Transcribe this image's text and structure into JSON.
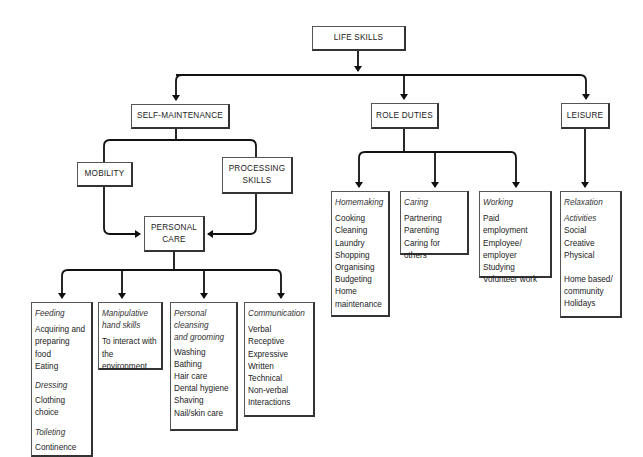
{
  "diagram": {
    "root": {
      "label": "LIFE SKILLS"
    },
    "level1": {
      "self_maintenance": "SELF-MAINTENANCE",
      "role_duties": "ROLE DUTIES",
      "leisure": "LEISURE"
    },
    "self_maintenance_children": {
      "mobility": "MOBILITY",
      "processing_line1": "PROCESSING",
      "processing_line2": "SKILLS",
      "personal_line1": "PERSONAL",
      "personal_line2": "CARE"
    },
    "personal_care_boxes": {
      "feeding": {
        "heading": "Feeding",
        "items": [
          "Acquiring and",
          "preparing food",
          "Eating"
        ],
        "heading2": "Dressing",
        "items2": [
          "Clothing",
          "choice"
        ],
        "heading3": "Toileting",
        "items3": [
          "Continence"
        ]
      },
      "manipulative": {
        "heading_line1": "Manipulative",
        "heading_line2": "hand skills",
        "items": [
          "To interact with",
          "the environment"
        ]
      },
      "cleansing": {
        "heading_line1": "Personal",
        "heading_line2": "cleansing",
        "heading_line3": "and grooming",
        "items": [
          "Washing",
          "Bathing",
          "Hair care",
          "Dental hygiene",
          "Shaving",
          "Nail/skin care"
        ]
      },
      "communication": {
        "heading": "Communication",
        "items": [
          "Verbal",
          "Receptive",
          "Expressive",
          "Written",
          "Technical",
          "Non-verbal",
          "Interactions"
        ]
      }
    },
    "role_duties_boxes": {
      "homemaking": {
        "heading": "Homemaking",
        "items": [
          "Cooking",
          "Cleaning",
          "Laundry",
          "Shopping",
          "Organising",
          "Budgeting",
          "Home",
          "maintenance"
        ]
      },
      "caring": {
        "heading": "Caring",
        "items": [
          "Partnering",
          "Parenting",
          "Caring for others"
        ]
      },
      "working": {
        "heading": "Working",
        "items": [
          "Paid employment",
          "Employee/",
          "employer",
          "Studying",
          "Volunteer work"
        ]
      }
    },
    "leisure_box": {
      "heading": "Relaxation",
      "heading2": "Activities",
      "items": [
        "Social",
        "Creative",
        "Physical"
      ],
      "items2": [
        "Home based/",
        "community",
        "Holidays"
      ]
    }
  }
}
